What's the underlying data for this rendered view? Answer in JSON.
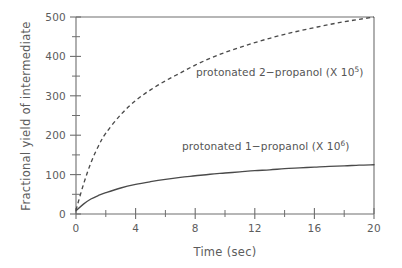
{
  "chart_data": {
    "type": "line",
    "title": "",
    "xlabel": "Time (sec)",
    "ylabel": "Fractional yield of intermediate",
    "xlim": [
      0,
      20
    ],
    "ylim": [
      0,
      500
    ],
    "grid": false,
    "legend_position": "inline-annotation",
    "x_ticks_major": [
      0,
      4,
      8,
      12,
      16,
      20
    ],
    "x_ticks_minor": [
      2,
      6,
      10,
      14,
      18
    ],
    "y_ticks_major": [
      0,
      100,
      200,
      300,
      400,
      500
    ],
    "y_ticks_minor": [
      50,
      150,
      250,
      350,
      450
    ],
    "x_tick_labels": [
      "0",
      "4",
      "8",
      "12",
      "16",
      "20"
    ],
    "y_tick_labels": [
      "0",
      "100",
      "200",
      "300",
      "400",
      "500"
    ],
    "x": [
      0,
      0.5,
      1,
      1.5,
      2,
      3,
      4,
      5,
      6,
      7,
      8,
      9,
      10,
      11,
      12,
      13,
      14,
      15,
      16,
      17,
      18,
      19,
      20
    ],
    "series": [
      {
        "name": "protonated 2-propanol (X 10^5)",
        "label_text": "protonated 2−propanol (X 10",
        "label_exponent": "5",
        "label_suffix": ")",
        "style": "dashed",
        "values": [
          10,
          75,
          130,
          172,
          205,
          252,
          288,
          315,
          338,
          358,
          378,
          395,
          410,
          423,
          435,
          446,
          456,
          465,
          473,
          481,
          488,
          494,
          500
        ]
      },
      {
        "name": "protonated 1-propanol (X 10^6)",
        "label_text": "protonated 1−propanol (X 10",
        "label_exponent": "6",
        "label_suffix": ")",
        "style": "solid",
        "values": [
          8,
          25,
          38,
          47,
          54,
          66,
          75,
          82,
          88,
          93,
          97,
          101,
          104,
          107,
          110,
          112,
          115,
          117,
          119,
          121,
          122,
          124,
          125
        ]
      }
    ],
    "annotations": [
      {
        "name": "series-label-2-propanol",
        "text": "protonated 2−propanol (X 10",
        "exponent": "5",
        "suffix": ")",
        "x_px": 196,
        "y_px": 76
      },
      {
        "name": "series-label-1-propanol",
        "text": "protonated 1−propanol (X 10",
        "exponent": "6",
        "suffix": ")",
        "x_px": 182,
        "y_px": 150
      }
    ],
    "colors": {
      "axis": "#6e6e6e",
      "curve": "#4a4a4a",
      "text": "#5c5c5c",
      "background": "#ffffff"
    }
  }
}
